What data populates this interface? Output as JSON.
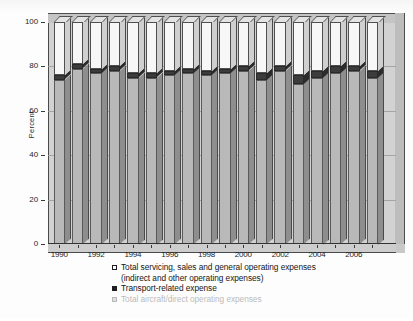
{
  "chart": {
    "type": "bar",
    "title": "",
    "ylabel": "Percent",
    "xlabel": ""
  },
  "yaxis": {
    "ticks": [
      "100",
      "80",
      "60",
      "40",
      "20",
      "0"
    ],
    "min": 0,
    "max": 100
  },
  "xaxis": {
    "labels": [
      "1990",
      "1992",
      "1994",
      "1996",
      "1998",
      "2000",
      "2002",
      "2004",
      "2006"
    ]
  },
  "legend": {
    "items": [
      {
        "marker": "open-square",
        "label": "Total servicing, sales and general operating expenses",
        "label_line2": "(indirect and other operating expenses)"
      },
      {
        "marker": "solid-square",
        "label": "Transport-related expense"
      },
      {
        "marker": "grey-square",
        "label": "Total aircraft/direct operating expenses"
      }
    ]
  },
  "chart_data": {
    "type": "bar",
    "title": "",
    "subtitle": "",
    "xlabel": "",
    "ylabel": "Percent",
    "ylim": [
      0,
      100
    ],
    "grid": true,
    "stacked": true,
    "normalized_percent": true,
    "legend_position": "bottom",
    "categories": [
      "1990",
      "1991",
      "1992",
      "1993",
      "1994",
      "1995",
      "1996",
      "1997",
      "1998",
      "1999",
      "2000",
      "2001",
      "2002",
      "2003",
      "2004",
      "2005",
      "2006",
      "2007"
    ],
    "tick_labels": [
      "1990",
      "",
      "1992",
      "",
      "1994",
      "",
      "1996",
      "",
      "1998",
      "",
      "2000",
      "",
      "2002",
      "",
      "2004",
      "",
      "2006",
      ""
    ],
    "series": [
      {
        "name": "Total aircraft/direct operating expenses",
        "color": "#b9b9b9",
        "values": [
          74,
          79,
          77,
          78,
          75,
          75,
          76,
          77,
          76,
          77,
          78,
          74,
          78,
          72,
          75,
          77,
          78,
          75
        ]
      },
      {
        "name": "Transport-related expense",
        "color": "#3c3c3c",
        "values": [
          2,
          2,
          2,
          2,
          2,
          2,
          2,
          2,
          2,
          2,
          2,
          3,
          2,
          4,
          3,
          3,
          2,
          3
        ]
      },
      {
        "name": "Total servicing, sales and general operating expenses (indirect and other operating expenses)",
        "color": "#f7f7f7",
        "values": [
          24,
          19,
          21,
          20,
          23,
          23,
          22,
          21,
          22,
          21,
          20,
          23,
          20,
          24,
          22,
          20,
          20,
          22
        ]
      }
    ]
  }
}
